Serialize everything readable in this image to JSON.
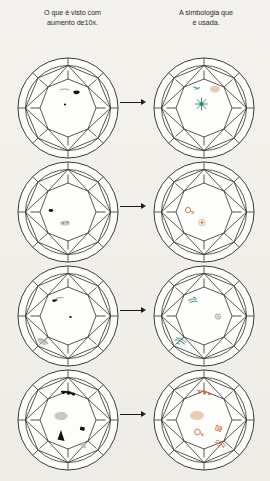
{
  "page": {
    "background_color": "#f2f0ec",
    "paper_tone": "scanned-cream"
  },
  "headers": {
    "left": {
      "line1": "O que é visto com",
      "line2": "aumento de10x."
    },
    "right": {
      "line1": "A simbologia que",
      "line2": "é usada."
    }
  },
  "colors": {
    "facet_line": "#3a3a3a",
    "dark_inclusion": "#14120f",
    "gray_cloud": "#b9b5ae",
    "red_symbol": "#c96a3c",
    "green_symbol": "#2f7f68",
    "gray_symbol": "#9b978f"
  },
  "arrow": {
    "label": "maps-to-arrow",
    "count": 4
  },
  "rows": [
    {
      "index": 1,
      "arrow": "→",
      "observed": {
        "caption": "O que é visto com aumento de10x.",
        "marks": [
          {
            "kind": "dark-feather",
            "position": "upper-center"
          },
          {
            "kind": "dark-pinpoint",
            "position": "center"
          },
          {
            "kind": "faint-gray-wisp",
            "position": "upper-center-left"
          }
        ]
      },
      "symbol": {
        "caption": "A simbologia que é usada.",
        "marks": [
          {
            "kind": "green-starburst",
            "position": "center",
            "color": "#2f7f68"
          },
          {
            "kind": "tan-smudge",
            "position": "upper-right",
            "color": "#d9a27a"
          },
          {
            "kind": "green-tick",
            "position": "upper-left-of-center",
            "color": "#2f7f68"
          }
        ]
      }
    },
    {
      "index": 2,
      "arrow": "→",
      "observed": {
        "caption": "O que é visto com aumento de10x.",
        "marks": [
          {
            "kind": "dark-pinpoint",
            "position": "mid-left"
          },
          {
            "kind": "dark-pinpoint-pair",
            "position": "lower-center"
          }
        ]
      },
      "symbol": {
        "caption": "A simbologia que é usada.",
        "marks": [
          {
            "kind": "red-open-circle",
            "position": "mid-left",
            "color": "#c96a3c"
          },
          {
            "kind": "red-dot",
            "position": "lower-center",
            "color": "#c96a3c"
          }
        ]
      }
    },
    {
      "index": 3,
      "arrow": "→",
      "observed": {
        "caption": "O que é visto com aumento de10x.",
        "marks": [
          {
            "kind": "dark-streak",
            "position": "upper-left"
          },
          {
            "kind": "dark-pinpoint",
            "position": "center"
          },
          {
            "kind": "gray-chip",
            "position": "lower-left-girdle"
          }
        ]
      },
      "symbol": {
        "caption": "A simbologia que é usada.",
        "marks": [
          {
            "kind": "green-squiggle",
            "position": "upper-left",
            "color": "#2f7f68"
          },
          {
            "kind": "gray-open-circle",
            "position": "mid-right",
            "color": "#9b978f"
          },
          {
            "kind": "green-hatch",
            "position": "lower-left-girdle",
            "color": "#2f7f68"
          }
        ]
      }
    },
    {
      "index": 4,
      "arrow": "→",
      "observed": {
        "caption": "O que é visto com aumento de10x.",
        "marks": [
          {
            "kind": "dark-pinpoint-row",
            "position": "top",
            "count": 3
          },
          {
            "kind": "gray-cloud",
            "position": "center-left"
          },
          {
            "kind": "dark-triangle-large",
            "position": "lower-center-left"
          },
          {
            "kind": "dark-triangle-small",
            "position": "mid-right"
          },
          {
            "kind": "gray-smudge",
            "position": "lower-right-girdle"
          }
        ]
      },
      "symbol": {
        "caption": "A simbologia que é usada.",
        "marks": [
          {
            "kind": "red-dot-row",
            "position": "top",
            "count": 3,
            "color": "#c96a3c"
          },
          {
            "kind": "tan-cloud",
            "position": "center-left",
            "color": "#d9a27a"
          },
          {
            "kind": "red-open-circle",
            "position": "lower-center-left",
            "color": "#c96a3c"
          },
          {
            "kind": "red-triangle",
            "position": "mid-right",
            "color": "#c96a3c"
          },
          {
            "kind": "red-hatch",
            "position": "lower-right-girdle",
            "color": "#c96a3c"
          }
        ]
      }
    }
  ]
}
